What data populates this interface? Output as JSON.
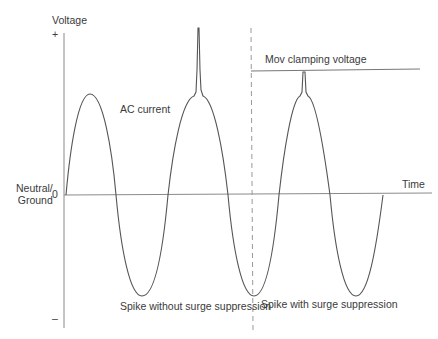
{
  "diagram": {
    "axes": {
      "y_label": "Voltage",
      "y_plus": "+",
      "y_minus": "–",
      "zero_label": "0",
      "ground_label_line1": "Neutral/",
      "ground_label_line2": "Ground",
      "x_label": "Time"
    },
    "labels": {
      "ac_current": "AC current",
      "clamping": "Mov clamping voltage",
      "without": "Spike without surge suppression",
      "with": "Spike with surge suppression"
    },
    "colors": {
      "line": "#555555",
      "axis": "#888888",
      "dashed": "#999999",
      "text": "#3a3a3a"
    }
  }
}
